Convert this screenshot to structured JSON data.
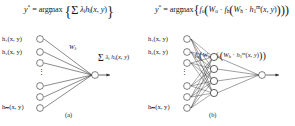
{
  "figure": {
    "panel_a": {
      "caption": "(a)",
      "formula": {
        "lhs": "y*",
        "eq": "=",
        "operator": "argmax",
        "operator_sub": "y",
        "body": "Σ λᵢhᵢ(x, y)",
        "sum_index": "i"
      },
      "inputs": [
        {
          "label": "h₁(x, y)"
        },
        {
          "label": "h₂(x, y)"
        },
        {
          "label": "hₘ(x, y)"
        }
      ],
      "ellipsis": "⋮",
      "weight_label": "Wλ",
      "output_label": "Σ λᵢ hᵢ(x, y)",
      "output_sum_index": "i",
      "node_count": 6,
      "output_node_count": 1
    },
    "panel_b": {
      "caption": "(b)",
      "formula": {
        "lhs": "y*",
        "eq": "=",
        "operator": "argmax",
        "operator_sub": "y",
        "body": "fₒ(Wₒ · fₕ(Wₕ · h₁ᵐ(x, y)))"
      },
      "inputs": [
        {
          "label": "h₁(x, y)"
        },
        {
          "label": "h₂(x, y)"
        },
        {
          "label": "hₘ(x, y)"
        }
      ],
      "ellipsis": "⋮",
      "output_label": "fₒ(Wₒ · fₕ(Wₕ · h₁ᵐ(x, y)))",
      "input_node_count": 6,
      "hidden_node_count": 4,
      "output_node_count": 1
    }
  },
  "colors": {
    "ink": "#2b2b2b",
    "background": "#ffffff",
    "node_fill": "#ffffff"
  }
}
